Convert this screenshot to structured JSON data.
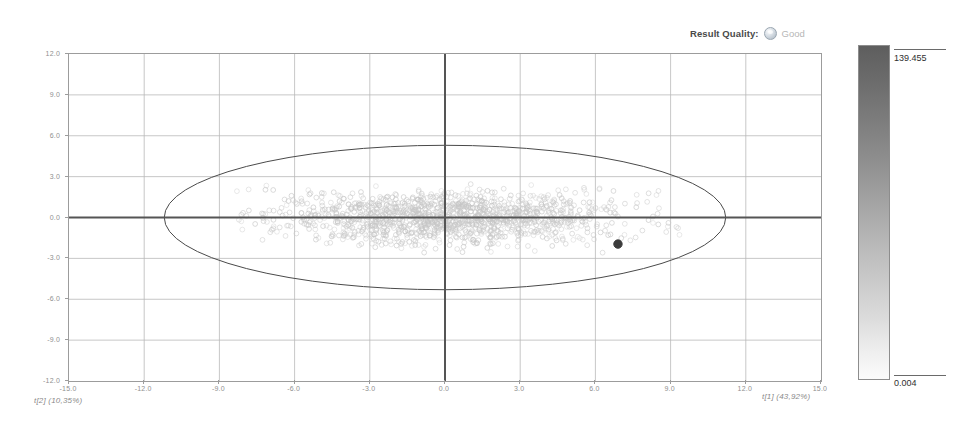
{
  "header": {
    "quality_label": "Result Quality:",
    "quality_value": "Good",
    "quality_icon": "status-circle-icon"
  },
  "legend": {
    "max_label": "139.455",
    "min_label": "0.004",
    "gradient_top_color": "#5e5e5e",
    "gradient_bottom_color": "#fbfbfb"
  },
  "chart_data": {
    "type": "scatter",
    "title": "",
    "xlabel": "t[1] (43,92%)",
    "ylabel": "t[2] (10,35%)",
    "xlim": [
      -15.0,
      15.0
    ],
    "ylim": [
      -12.0,
      12.0
    ],
    "xticks": [
      "-15.0",
      "-12.0",
      "-9.0",
      "-6.0",
      "-3.0",
      "0.0",
      "3.0",
      "6.0",
      "9.0",
      "12.0",
      "15.0"
    ],
    "yticks": [
      "12.0",
      "9.0",
      "6.0",
      "3.0",
      "0.0",
      "-3.0",
      "-6.0",
      "-9.0",
      "-12.0"
    ],
    "xtick_values": [
      -15,
      -12,
      -9,
      -6,
      -3,
      0,
      3,
      6,
      9,
      12,
      15
    ],
    "ytick_values": [
      12,
      9,
      6,
      3,
      0,
      -3,
      -6,
      -9,
      -12
    ],
    "grid": true,
    "legend_position": "right",
    "axis_lines": {
      "x_at": 0,
      "y_at": 0
    },
    "hotelling_ellipse": {
      "name": "Hotelling T2 (95%)",
      "center": [
        0,
        0
      ],
      "semi_axis_x": 11.2,
      "semi_axis_y": 5.3,
      "stroke": "#4a4a4a"
    },
    "series": [
      {
        "name": "Observations",
        "marker": "open-circle",
        "color": "#c6c6c6",
        "n_points": 1400,
        "cloud": {
          "center": [
            0.0,
            0.0
          ],
          "sigma_x": 3.4,
          "sigma_y": 0.95,
          "x_range": [
            -8.5,
            9.5
          ],
          "y_range": [
            -2.6,
            2.6
          ]
        }
      },
      {
        "name": "Highlighted observation",
        "marker": "filled-circle",
        "color": "#3c3c3c",
        "points": [
          [
            6.9,
            -1.95
          ]
        ]
      }
    ]
  }
}
